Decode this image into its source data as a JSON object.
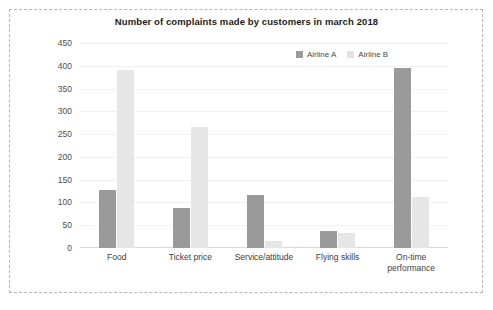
{
  "chart_data": {
    "type": "bar",
    "title": "Number of complaints made by customers in march 2018",
    "xlabel": "",
    "ylabel": "",
    "categories": [
      "Food",
      "Ticket price",
      "Service/attitude",
      "Flying skills",
      "On-time performance"
    ],
    "series": [
      {
        "name": "Airline A",
        "color": "#9a9a9a",
        "values": [
          128,
          88,
          116,
          38,
          395
        ]
      },
      {
        "name": "Airline B",
        "color": "#e6e6e6",
        "values": [
          390,
          265,
          16,
          33,
          111
        ]
      }
    ],
    "ylim": [
      0,
      450
    ],
    "yticks": [
      0,
      50,
      100,
      150,
      200,
      250,
      300,
      350,
      400,
      450
    ],
    "ytick_labels": [
      "0",
      "50",
      "100",
      "150",
      "200",
      "250",
      "300",
      "350",
      "400",
      "450"
    ],
    "grid": true,
    "legend_position": "top-right"
  },
  "legend": {
    "items": [
      {
        "label": "Airline A",
        "swatch_color": "#9a9a9a"
      },
      {
        "label": "Airline B",
        "swatch_color": "#e2e2e2"
      }
    ]
  },
  "colors": {
    "frame_border": "#b9b0c4",
    "gridline": "#f0f0f0",
    "axis": "#d8d8d8",
    "title_text": "#1c1c1c",
    "tick_text": "#4d4d4d"
  }
}
